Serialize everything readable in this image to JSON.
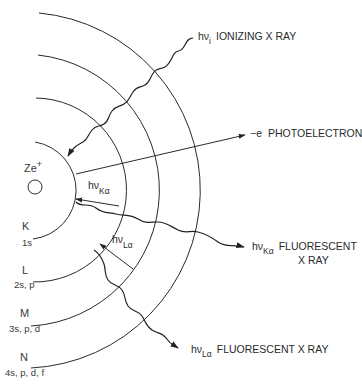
{
  "diagram": {
    "type": "atomic x-ray fluorescence schematic",
    "nucleus": {
      "label": "Ze",
      "charge": "+"
    },
    "shells": [
      {
        "name": "K",
        "orbitals": "1s"
      },
      {
        "name": "L",
        "orbitals": "2s, p"
      },
      {
        "name": "M",
        "orbitals": "3s, p, d"
      },
      {
        "name": "N",
        "orbitals": "4s, p, d, f"
      }
    ],
    "rays": {
      "ionizing": {
        "symbol": "hν",
        "subscript": "i",
        "text": "IONIZING X RAY"
      },
      "photoelectron": {
        "symbol": "−e",
        "text": "PHOTOELECTRON"
      },
      "k_alpha_transition": {
        "symbol": "hν",
        "subscript": "Kα"
      },
      "k_alpha_fluorescent": {
        "symbol": "hν",
        "subscript": "Kα",
        "text": "FLUORESCENT",
        "text2": "X RAY"
      },
      "l_alpha_transition": {
        "symbol": "hν",
        "subscript": "Lα"
      },
      "l_alpha_fluorescent": {
        "symbol": "hν",
        "subscript": "Lα",
        "text": "FLUORESCENT X RAY"
      }
    }
  }
}
